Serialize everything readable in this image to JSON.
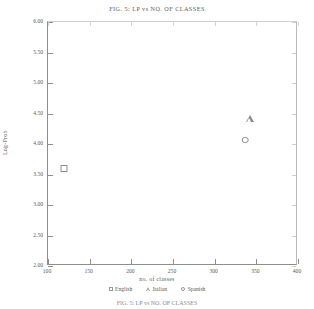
{
  "chart_data": {
    "type": "scatter",
    "title": "FIG. 5: LP vs NO. OF CLASSES",
    "xlabel": "no. of classes",
    "ylabel": "Log-Prob",
    "xlim": [
      100,
      400
    ],
    "ylim": [
      2.0,
      6.0
    ],
    "grid": false,
    "legend_position": "bottom",
    "xticks": [
      100,
      150,
      200,
      250,
      300,
      350,
      400
    ],
    "xtick_labels": [
      "100",
      "150",
      "200",
      "250",
      "300",
      "350",
      "400"
    ],
    "yticks": [
      2.0,
      2.5,
      3.0,
      3.5,
      4.0,
      4.5,
      5.0,
      5.5,
      6.0
    ],
    "ytick_labels": [
      "2.00",
      "2.50",
      "3.00",
      "3.50",
      "4.00",
      "4.50",
      "5.00",
      "5.50",
      "6.00"
    ],
    "series": [
      {
        "name": "English",
        "marker": "square",
        "x": [
          120
        ],
        "y": [
          3.6
        ]
      },
      {
        "name": "Italian",
        "marker": "triangle",
        "x": [
          343
        ],
        "y": [
          4.42
        ]
      },
      {
        "name": "Spanish",
        "marker": "circle",
        "x": [
          338
        ],
        "y": [
          4.08
        ]
      }
    ]
  },
  "legend": {
    "items": [
      {
        "label": "English",
        "marker": "square"
      },
      {
        "label": "Italian",
        "marker": "triangle"
      },
      {
        "label": "Spanish",
        "marker": "circle"
      }
    ]
  },
  "caption_cut": "FIG. 5: LP vs NO. OF CLASSES"
}
